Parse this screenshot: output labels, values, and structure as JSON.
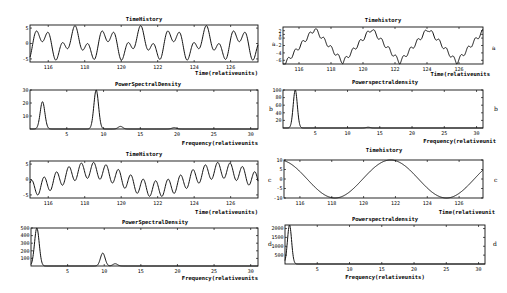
{
  "figure": {
    "panel_letters": [
      "a",
      "b",
      "c",
      "d"
    ]
  },
  "chart_data": [
    {
      "id": "left-a-time",
      "type": "line",
      "title": "TimeHistory",
      "xlabel": "Time(relativeunits)",
      "ylabel": "",
      "xlim": [
        115,
        127.5
      ],
      "ylim": [
        -6,
        6
      ],
      "xticks": [
        "116",
        "118",
        "120",
        "122",
        "124",
        "126"
      ],
      "yticks": [
        "5",
        "0",
        "-5"
      ],
      "description": "Multi-frequency oscillation (periods ~1.8 and ~0.7 units), amplitude about ±6"
    },
    {
      "id": "left-a-psd",
      "type": "line",
      "title": "PowerSpectralDensity",
      "xlabel": "Frequency(relativeunits)",
      "xlim": [
        0,
        31
      ],
      "ylim": [
        0,
        30
      ],
      "xticks": [
        "5",
        "10",
        "15",
        "20",
        "25",
        "30"
      ],
      "yticks": [
        "30",
        "20",
        "10"
      ],
      "peaks": [
        {
          "x": 1.7,
          "y": 21
        },
        {
          "x": 9.0,
          "y": 30
        },
        {
          "x": 12.3,
          "y": 2
        },
        {
          "x": 19.6,
          "y": 1
        }
      ]
    },
    {
      "id": "left-c-time",
      "type": "line",
      "title": "TimeHistory",
      "xlabel": "Time(relativeunits)",
      "xlim": [
        115,
        127.5
      ],
      "ylim": [
        -6,
        6
      ],
      "xticks": [
        "116",
        "118",
        "120",
        "122",
        "124",
        "126"
      ],
      "yticks": [
        "5",
        "0",
        "-5"
      ],
      "description": "Fast oscillation riding on a slow wave of period ~7 units"
    },
    {
      "id": "left-c-psd",
      "type": "line",
      "title": "PowerSpectralDensity",
      "xlabel": "Frequency(relativeunits)",
      "xlim": [
        0,
        31
      ],
      "ylim": [
        0,
        500
      ],
      "xticks": [
        "5",
        "10",
        "15",
        "20",
        "25",
        "30"
      ],
      "yticks": [
        "500",
        "400",
        "300",
        "200",
        "100"
      ],
      "peaks": [
        {
          "x": 0.8,
          "y": 500
        },
        {
          "x": 9.8,
          "y": 170
        },
        {
          "x": 11.5,
          "y": 30
        }
      ]
    },
    {
      "id": "right-a-time",
      "type": "line",
      "title": "Timehistory",
      "xlabel": "Time(relativeunits",
      "xlim": [
        115,
        127.5
      ],
      "ylim": [
        -7,
        3
      ],
      "xticks": [
        "116",
        "118",
        "120",
        "122",
        "124",
        "126"
      ],
      "yticks": [
        "2",
        "1",
        "0",
        "-2",
        "-4",
        "-6"
      ],
      "description": "Stepped triangular-like wave with period ~3.5 units"
    },
    {
      "id": "right-b-psd",
      "type": "line",
      "title": "Powerspectraldensity",
      "xlabel": "Frequency(relativeunit",
      "xlim": [
        0,
        31
      ],
      "ylim": [
        0,
        100
      ],
      "xticks": [
        "5",
        "10",
        "15",
        "20",
        "25",
        "30"
      ],
      "yticks": [
        "100",
        "80",
        "60",
        "40",
        "20"
      ],
      "peaks": [
        {
          "x": 1.9,
          "y": 100
        },
        {
          "x": 13.2,
          "y": 2
        }
      ]
    },
    {
      "id": "right-c-time",
      "type": "line",
      "title": "Timehistory",
      "xlabel": "Time(relativeunit",
      "xlim": [
        115,
        127.5
      ],
      "ylim": [
        -10,
        10
      ],
      "xticks": [
        "116",
        "118",
        "120",
        "122",
        "124",
        "126"
      ],
      "yticks": [
        "10",
        "5",
        "0",
        "-5",
        "-10"
      ],
      "description": "Smooth sinusoid of period ~7 units, amplitude 10"
    },
    {
      "id": "right-d-psd",
      "type": "line",
      "title": "Powerspectraldensity",
      "xlabel": "Frequency(relativeunits)",
      "xlim": [
        0,
        31
      ],
      "ylim": [
        0,
        2200
      ],
      "xticks": [
        "5",
        "10",
        "15",
        "20",
        "25",
        "30"
      ],
      "yticks": [
        "2000",
        "1500",
        "1000",
        "500"
      ],
      "peaks": [
        {
          "x": 0.7,
          "y": 2200
        }
      ]
    }
  ],
  "labels": {
    "left_a_title": "TimeHistory",
    "left_a_xlabel": "Time(relativeunits)",
    "left_b_title": "PowerSpectralDensity",
    "left_b_xlabel": "Frequency(relativeunits",
    "left_c_title": "TimeHistory",
    "left_c_xlabel": "Time(relativeunits)",
    "left_d_title": "PowerSpectralDensity",
    "left_d_xlabel": "Frequency(relativeunits",
    "right_a_title": "Timehistory",
    "right_a_xlabel": "Time(relativeunits",
    "right_b_title": "Powerspectraldensity",
    "right_b_xlabel": "Frequency(relativeunit",
    "right_c_title": "Timehistory",
    "right_c_xlabel": "Time(relativeunit",
    "right_d_title": "Powerspectraldensity",
    "right_d_xlabel": "Frequency(relativeunits)",
    "letter_a": "a",
    "letter_b": "b",
    "letter_c": "c",
    "letter_d": "d",
    "time_ticks": [
      "116",
      "118",
      "120",
      "122",
      "124",
      "126"
    ],
    "freq_ticks": [
      "5",
      "10",
      "15",
      "20",
      "25",
      "30"
    ],
    "la_yticks": [
      "5",
      "0",
      "-5"
    ],
    "lb_yticks": [
      "30",
      "20",
      "10"
    ],
    "lc_yticks": [
      "5",
      "0",
      "-5"
    ],
    "ld_yticks": [
      "500",
      "400",
      "300",
      "200",
      "100"
    ],
    "ra_yticks": [
      "2",
      "1",
      "0",
      "-2",
      "-4",
      "-6"
    ],
    "rb_yticks": [
      "100",
      "80",
      "60",
      "40",
      "20"
    ],
    "rc_yticks": [
      "10",
      "5",
      "0",
      "-5",
      "-10"
    ],
    "rd_yticks": [
      "2000",
      "1500",
      "1000",
      "500"
    ]
  }
}
